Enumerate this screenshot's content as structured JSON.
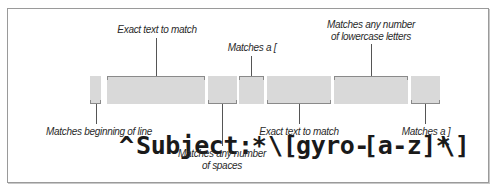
{
  "diagram": {
    "regex": "^Subject: *\\[gyro-[a-z]*\\]",
    "tokens": [
      {
        "text": "^",
        "annotation": "Matches beginning of line",
        "position": "below"
      },
      {
        "text": "Subject:",
        "annotation": "Exact text to match",
        "position": "above"
      },
      {
        "text": " *",
        "annotation": "Matches any number of spaces",
        "position": "below"
      },
      {
        "text": "\\[",
        "annotation": "Matches a [",
        "position": "above"
      },
      {
        "text": "gyro-",
        "annotation": "Exact text to match",
        "position": "below"
      },
      {
        "text": "[a-z]*",
        "annotation": "Matches any number of lowercase letters",
        "position": "above"
      },
      {
        "text": "\\]",
        "annotation": "Matches a ]",
        "position": "below"
      }
    ],
    "labels": {
      "caret": "Matches beginning of line",
      "subject": "Exact text to match",
      "spaces_line1": "Matches any number",
      "spaces_line2": "of spaces",
      "lbracket": "Matches a [",
      "gyro": "Exact text to match",
      "letters_line1": "Matches any number",
      "letters_line2": "of lowercase letters",
      "rbracket": "Matches a ]"
    },
    "colors": {
      "token_fill": "#d9d9d9",
      "token_text": "#1a1a1a",
      "callout_line": "#555555",
      "frame_border": "#9a9a9a"
    }
  }
}
